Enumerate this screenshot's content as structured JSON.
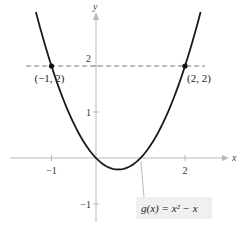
{
  "chart_data": {
    "type": "line",
    "title": "",
    "xlabel": "x",
    "ylabel": "y",
    "xlim": [
      -1.75,
      2.6
    ],
    "ylim": [
      -1.55,
      3.2
    ],
    "grid": false,
    "x_ticks": [
      {
        "value": -1,
        "label": "−1"
      },
      {
        "value": 2,
        "label": "2"
      }
    ],
    "y_ticks": [
      {
        "value": 2,
        "label": "2"
      },
      {
        "value": 1,
        "label": "1"
      },
      {
        "value": -1,
        "label": "−1"
      }
    ],
    "series": [
      {
        "name": "g(x) = x² − x",
        "function": "x^2 - x",
        "x_range": [
          -1.35,
          2.35
        ],
        "style": "solid"
      },
      {
        "name": "y = 2",
        "function": "2",
        "x_range": [
          -1.75,
          2.45
        ],
        "style": "dashed"
      }
    ],
    "points": [
      {
        "x": -1,
        "y": 2,
        "label": "(−1, 2)"
      },
      {
        "x": 2,
        "y": 2,
        "label": "(2, 2)"
      }
    ],
    "annotations": [
      {
        "text": "g(x) = x² − x",
        "points_to": {
          "x": 1.1,
          "y": 0.1
        }
      }
    ]
  }
}
